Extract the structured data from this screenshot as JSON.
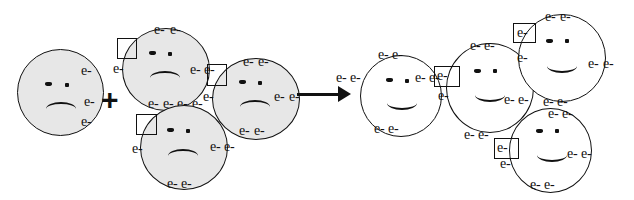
{
  "diagram": {
    "operators": {
      "plus": "+",
      "arrow": "arrow-right"
    },
    "electron_label": "e-",
    "colors": {
      "reactant_fill": "#e7e7e7",
      "product_fill": "#ffffff",
      "stroke": "#111111",
      "background": "#ffffff"
    },
    "reactants": [
      {
        "id": "reactant-atom-1",
        "mood": "sad",
        "fill": "#e7e7e7",
        "electrons": [
          "e-",
          "e-",
          "e-"
        ],
        "highlight_boxes": 0
      },
      {
        "id": "reactant-atom-2",
        "mood": "sad",
        "fill": "#e7e7e7",
        "electrons": [
          "e-",
          "e-",
          "e-",
          "e-",
          "e-",
          "e-",
          "e-",
          "e-"
        ],
        "highlight_boxes": 1
      },
      {
        "id": "reactant-atom-3",
        "mood": "sad",
        "fill": "#e7e7e7",
        "electrons": [
          "e-",
          "e-",
          "e-",
          "e-",
          "e-",
          "e-",
          "e-"
        ],
        "highlight_boxes": 1
      },
      {
        "id": "reactant-atom-4",
        "mood": "sad",
        "fill": "#e7e7e7",
        "electrons": [
          "e-",
          "e-",
          "e-",
          "e-",
          "e-",
          "e-"
        ],
        "highlight_boxes": 1
      }
    ],
    "products": [
      {
        "id": "product-atom-1",
        "mood": "happy",
        "fill": "#ffffff",
        "electrons": [
          "e-",
          "e-",
          "e-",
          "e-",
          "e-",
          "e-"
        ],
        "highlight_boxes": 0
      },
      {
        "id": "product-atom-2",
        "mood": "happy",
        "fill": "#ffffff",
        "electrons": [
          "e-",
          "e-",
          "e-",
          "e-",
          "e-",
          "e-",
          "e-",
          "e-"
        ],
        "highlight_boxes": 1
      },
      {
        "id": "product-atom-3",
        "mood": "happy",
        "fill": "#ffffff",
        "electrons": [
          "e-",
          "e-",
          "e-",
          "e-",
          "e-",
          "e-",
          "e-",
          "e-"
        ],
        "highlight_boxes": 1
      },
      {
        "id": "product-atom-4",
        "mood": "happy",
        "fill": "#ffffff",
        "electrons": [
          "e-",
          "e-",
          "e-",
          "e-",
          "e-",
          "e-",
          "e-"
        ],
        "highlight_boxes": 1
      }
    ],
    "labels": {
      "e1": "e-",
      "e2": "e-",
      "e3": "e-",
      "e4": "e-",
      "e5": "e-",
      "e6": "e-",
      "e7": "e-",
      "e8": "e-",
      "e9": "e-",
      "e10": "e-",
      "e11": "e-",
      "e12": "e-",
      "e13": "e-",
      "e14": "e-",
      "e15": "e-",
      "e16": "e-",
      "e17": "e-",
      "e18": "e-",
      "e19": "e-",
      "e20": "e-",
      "e21": "e-",
      "e22": "e-",
      "e23": "e-",
      "e24": "e-",
      "e25": "e-",
      "e26": "e-",
      "e27": "e-",
      "e28": "e-",
      "e29": "e-",
      "e30": "e-",
      "e31": "e-",
      "e32": "e-",
      "e33": "e-",
      "e34": "e-",
      "e35": "e-",
      "e36": "e-",
      "e37": "e-",
      "e38": "e-",
      "e39": "e-",
      "e40": "e-",
      "e41": "e-",
      "e42": "e-",
      "e43": "e-",
      "e44": "e-",
      "e45": "e-",
      "e46": "e-",
      "e47": "e-",
      "e48": "e-",
      "e49": "e-",
      "e50": "e-",
      "e51": "e-",
      "e52": "e-",
      "e53": "e-",
      "e54": "e-",
      "e55": "e-",
      "e56": "e-",
      "e57": "e-",
      "e58": "e-",
      "e59": "e-",
      "e60": "e-",
      "e61": "e-",
      "e62": "e-"
    }
  }
}
